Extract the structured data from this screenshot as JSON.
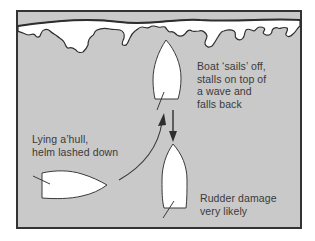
{
  "diagram": {
    "colors": {
      "sea": "#c9c9c9",
      "foam": "#ffffff",
      "outline": "#2e2e2e",
      "frame": "#333333",
      "text": "#3a3a3a"
    },
    "elements": {
      "wave_crest": "breaking-wave-foam",
      "boat_lying_ahull": "boat-beam-on",
      "boat_sailing_off": "boat-bow-up",
      "boat_falling_back": "boat-stern-first",
      "arrow_up": "curved-arrow-up",
      "arrow_down": "straight-arrow-down"
    },
    "labels": {
      "sails_off": [
        "Boat ‘sails’ off,",
        "stalls on top of",
        "a wave and",
        "falls back"
      ],
      "lying_ahull": [
        "Lying a’hull,",
        "helm lashed down"
      ],
      "rudder_damage": [
        "Rudder damage",
        "very likely"
      ]
    }
  }
}
